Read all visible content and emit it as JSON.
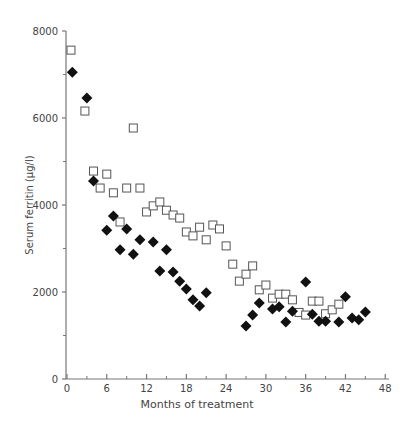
{
  "chart_data": {
    "type": "scatter",
    "title": "",
    "xlabel": "Months of treatment",
    "ylabel": "Serum ferritin (μg/l)",
    "xlim": [
      0,
      48
    ],
    "ylim": [
      0,
      8000
    ],
    "xticks": [
      0,
      6,
      12,
      18,
      24,
      30,
      36,
      42,
      48
    ],
    "yticks": [
      0,
      2000,
      4000,
      6000,
      8000
    ],
    "grid": false,
    "legend": null,
    "series": [
      {
        "name": "open squares",
        "marker": "square-open",
        "color": "#555555",
        "points": [
          [
            0.6,
            7560
          ],
          [
            2.7,
            6160
          ],
          [
            4,
            4780
          ],
          [
            5,
            4390
          ],
          [
            6,
            4710
          ],
          [
            7,
            4280
          ],
          [
            8,
            3610
          ],
          [
            9,
            4390
          ],
          [
            10,
            5770
          ],
          [
            11,
            4390
          ],
          [
            12,
            3840
          ],
          [
            13,
            3980
          ],
          [
            14,
            4070
          ],
          [
            15,
            3880
          ],
          [
            16,
            3770
          ],
          [
            17,
            3700
          ],
          [
            18,
            3380
          ],
          [
            19,
            3290
          ],
          [
            20,
            3490
          ],
          [
            21,
            3200
          ],
          [
            22,
            3540
          ],
          [
            23,
            3450
          ],
          [
            24,
            3060
          ],
          [
            25,
            2640
          ],
          [
            26,
            2250
          ],
          [
            27,
            2410
          ],
          [
            28,
            2600
          ],
          [
            29,
            2050
          ],
          [
            30,
            2160
          ],
          [
            31,
            1860
          ],
          [
            32,
            1950
          ],
          [
            33,
            1950
          ],
          [
            34,
            1820
          ],
          [
            35,
            1530
          ],
          [
            36,
            1470
          ],
          [
            37,
            1790
          ],
          [
            38,
            1790
          ],
          [
            39,
            1500
          ],
          [
            40,
            1590
          ],
          [
            41,
            1720
          ]
        ]
      },
      {
        "name": "filled diamonds",
        "marker": "diamond-filled",
        "color": "#111111",
        "points": [
          [
            0.8,
            7050
          ],
          [
            3,
            6460
          ],
          [
            4,
            4550
          ],
          [
            6,
            3420
          ],
          [
            7,
            3750
          ],
          [
            8,
            2970
          ],
          [
            9,
            3450
          ],
          [
            10,
            2870
          ],
          [
            11,
            3200
          ],
          [
            13,
            3150
          ],
          [
            14,
            2480
          ],
          [
            15,
            2970
          ],
          [
            16,
            2460
          ],
          [
            17,
            2250
          ],
          [
            18,
            2070
          ],
          [
            19,
            1820
          ],
          [
            20,
            1680
          ],
          [
            21,
            1980
          ],
          [
            27,
            1220
          ],
          [
            28,
            1470
          ],
          [
            29,
            1750
          ],
          [
            31,
            1610
          ],
          [
            32,
            1660
          ],
          [
            33,
            1310
          ],
          [
            34,
            1560
          ],
          [
            36,
            2230
          ],
          [
            37,
            1490
          ],
          [
            38,
            1330
          ],
          [
            39,
            1330
          ],
          [
            41,
            1310
          ],
          [
            42,
            1890
          ],
          [
            43,
            1400
          ],
          [
            44,
            1360
          ],
          [
            45,
            1540
          ]
        ]
      }
    ]
  },
  "axes": {
    "x_label": "Months of treatment",
    "y_label": "Serum ferritin (μg/l)",
    "x_tick_labels": [
      "0",
      "6",
      "12",
      "18",
      "24",
      "30",
      "36",
      "42",
      "48"
    ],
    "y_tick_labels": [
      "0",
      "2000",
      "4000",
      "6000",
      "8000"
    ]
  }
}
